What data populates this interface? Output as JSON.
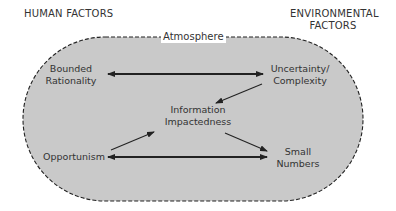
{
  "headers": {
    "left": "HUMAN FACTORS",
    "right_line1": "ENVIRONMENTAL",
    "right_line2": "FACTORS"
  },
  "boundary": {
    "label": "Atmosphere",
    "fill": "#c8c8c8",
    "stroke": "#222222",
    "style": "dashed"
  },
  "nodes": {
    "bounded_rationality": {
      "line1": "Bounded",
      "line2": "Rationality"
    },
    "uncertainty_complexity": {
      "line1": "Uncertainty/",
      "line2": "Complexity"
    },
    "information_impactedness": {
      "line1": "Information",
      "line2": "Impactedness"
    },
    "opportunism": {
      "line1": "Opportunism"
    },
    "small_numbers": {
      "line1": "Small",
      "line2": "Numbers"
    }
  },
  "edges": [
    {
      "from": "Bounded Rationality",
      "to": "Uncertainty/Complexity",
      "type": "bidirectional"
    },
    {
      "from": "Uncertainty/Complexity",
      "to": "Information Impactedness",
      "type": "directed"
    },
    {
      "from": "Opportunism",
      "to": "Information Impactedness",
      "type": "directed"
    },
    {
      "from": "Information Impactedness",
      "to": "Small Numbers",
      "type": "directed"
    },
    {
      "from": "Opportunism",
      "to": "Small Numbers",
      "type": "bidirectional"
    }
  ]
}
